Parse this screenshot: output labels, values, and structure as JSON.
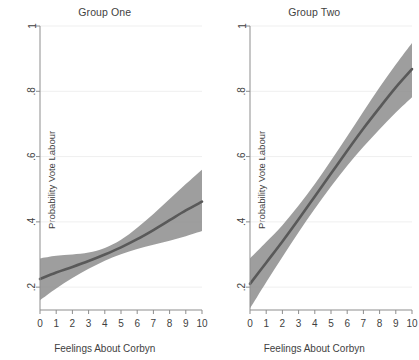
{
  "figure": {
    "xlabel": "Feelings About Corbyn",
    "ylabel": "Probability Vote Labour"
  },
  "panels": [
    {
      "title": "Group One"
    },
    {
      "title": "Group Two"
    }
  ],
  "axis": {
    "y_ticks": [
      "1",
      ".8",
      ".6",
      ".4",
      ".2"
    ],
    "x_ticks": [
      "0",
      "1",
      "2",
      "3",
      "4",
      "5",
      "6",
      "7",
      "8",
      "9",
      "10"
    ]
  },
  "colors": {
    "line": "#595959",
    "band": "#8d8d8d",
    "axis": "#8d8d8d",
    "grid": "#efefef",
    "text": "#3f3f3f",
    "background": "#ffffff"
  },
  "chart_data": {
    "type": "line",
    "title": "",
    "xlabel": "Feelings About Corbyn",
    "ylabel": "Probability Vote Labour",
    "xlim": [
      0,
      10
    ],
    "ylim": [
      0.13,
      1.0
    ],
    "grid": true,
    "legend": "none",
    "y_tick_values": [
      1,
      0.8,
      0.6,
      0.4,
      0.2
    ],
    "x": [
      0,
      1,
      2,
      3,
      4,
      5,
      6,
      7,
      8,
      9,
      10
    ],
    "panels": [
      {
        "name": "Group One",
        "series": [
          {
            "name": "Predicted probability",
            "values": [
              0.225,
              0.245,
              0.262,
              0.28,
              0.3,
              0.322,
              0.347,
              0.375,
              0.405,
              0.435,
              0.462
            ],
            "ci_lower": [
              0.16,
              0.196,
              0.228,
              0.256,
              0.281,
              0.301,
              0.317,
              0.33,
              0.342,
              0.356,
              0.372
            ],
            "ci_upper": [
              0.288,
              0.296,
              0.3,
              0.306,
              0.32,
              0.345,
              0.382,
              0.424,
              0.47,
              0.516,
              0.56
            ]
          }
        ]
      },
      {
        "name": "Group Two",
        "series": [
          {
            "name": "Predicted probability",
            "values": [
              0.21,
              0.275,
              0.34,
              0.408,
              0.478,
              0.548,
              0.618,
              0.686,
              0.75,
              0.812,
              0.868
            ],
            "ci_lower": [
              0.135,
              0.215,
              0.292,
              0.368,
              0.44,
              0.508,
              0.572,
              0.63,
              0.684,
              0.735,
              0.782
            ],
            "ci_upper": [
              0.288,
              0.338,
              0.39,
              0.45,
              0.516,
              0.588,
              0.662,
              0.738,
              0.812,
              0.882,
              0.948
            ]
          }
        ]
      }
    ]
  }
}
